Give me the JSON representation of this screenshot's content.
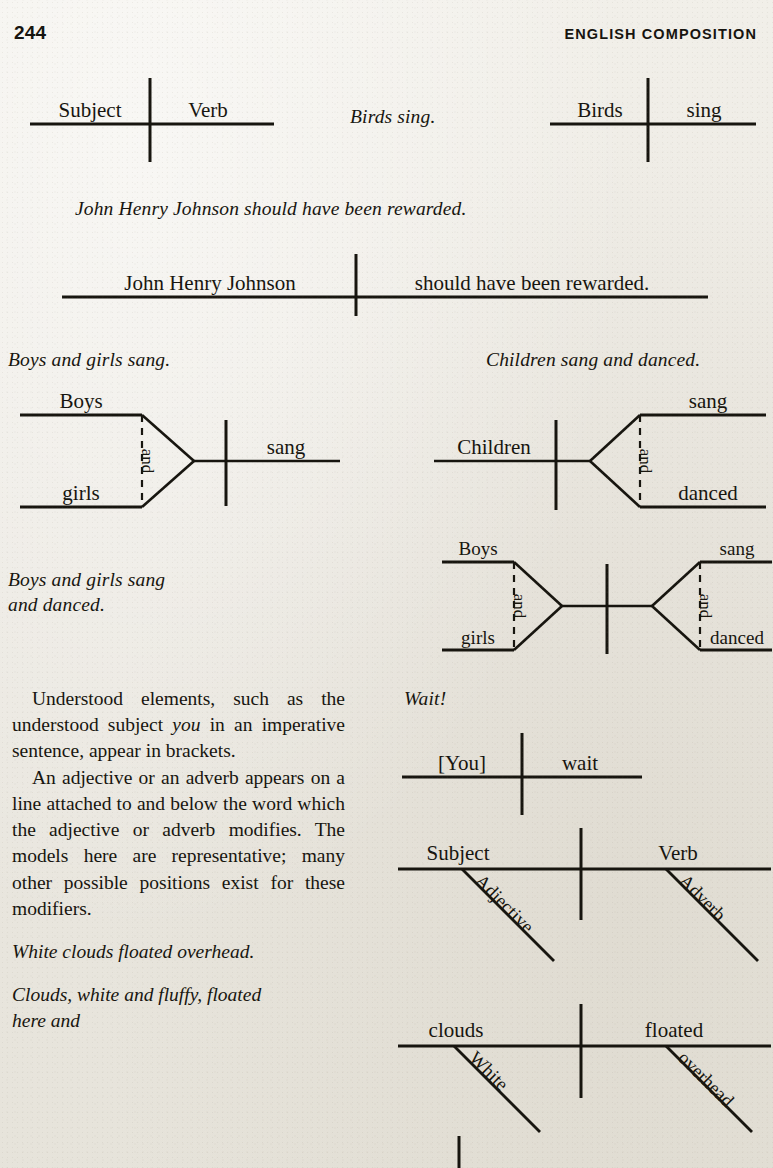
{
  "page": {
    "folio": "244",
    "running_head": "ENGLISH COMPOSITION",
    "background_color": "#edebe5",
    "ink_color": "#17150f"
  },
  "examples": {
    "birds_sing": "Birds sing.",
    "john_henry": "John Henry Johnson should have been rewarded.",
    "boys_girls_sang": "Boys and girls sang.",
    "children_sang_danced": "Children sang and danced.",
    "boys_girls_sang_danced": "Boys and girls sang\nand danced.",
    "wait": "Wait!",
    "white_clouds": "White clouds floated overhead.",
    "clouds_white_fluffy": "Clouds, white and fluffy, floated\nhere and"
  },
  "body": {
    "para1_pre": "Understood elements, such as the understood subject ",
    "para1_em": "you",
    "para1_post": " in an imperative sentence, appear in brackets.",
    "para2": "An adjective or an adverb appears on a line attached to and below the word which the adjective or adverb modifies. The models here are representative; many other possible positions exist for these modifiers."
  },
  "diagrams": {
    "subject_verb_template": {
      "subject": "Subject",
      "verb": "Verb"
    },
    "birds_sing": {
      "subject": "Birds",
      "verb": "sing"
    },
    "john_henry": {
      "subject": "John Henry Johnson",
      "verb": "should have been rewarded."
    },
    "compound_subject": {
      "subject_a": "Boys",
      "subject_b": "girls",
      "conjunction": "and",
      "verb": "sang"
    },
    "compound_predicate": {
      "subject": "Children",
      "verb_a": "sang",
      "verb_b": "danced",
      "conjunction": "and"
    },
    "compound_both": {
      "subject_a": "Boys",
      "subject_b": "girls",
      "conjunction_left": "and",
      "verb_a": "sang",
      "verb_b": "danced",
      "conjunction_right": "and"
    },
    "imperative": {
      "subject": "[You]",
      "verb": "wait"
    },
    "modifier_template": {
      "subject": "Subject",
      "verb": "Verb",
      "adjective": "Adjective",
      "adverb": "Adverb"
    },
    "clouds_floated": {
      "subject": "clouds",
      "verb": "floated",
      "adjective": "White",
      "adverb": "overhead"
    }
  }
}
